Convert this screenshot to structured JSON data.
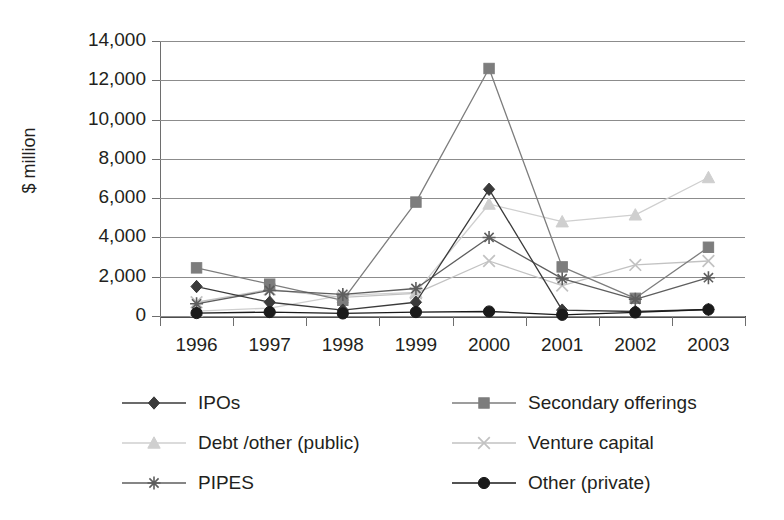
{
  "chart_data": {
    "type": "line",
    "title": "",
    "xlabel": "",
    "ylabel": "$ million",
    "ylim": [
      0,
      14000
    ],
    "ytick_step": 2000,
    "grid": true,
    "legend_position": "bottom",
    "categories": [
      "1996",
      "1997",
      "1998",
      "1999",
      "2000",
      "2001",
      "2002",
      "2003"
    ],
    "ytick_labels": [
      "0",
      "2,000",
      "4,000",
      "6,000",
      "8,000",
      "10,000",
      "12,000",
      "14,000"
    ],
    "series": [
      {
        "name": "IPOs",
        "marker": "diamond",
        "color": "#3a3a3a",
        "values": [
          1500,
          700,
          300,
          700,
          6450,
          300,
          230,
          330
        ]
      },
      {
        "name": "Secondary offerings",
        "marker": "square",
        "color": "#7d7d7d",
        "values": [
          2450,
          1620,
          800,
          5800,
          12600,
          2500,
          900,
          3500
        ]
      },
      {
        "name": "Debt /other (public)",
        "marker": "triangle",
        "color": "#cfcfcf",
        "values": [
          250,
          400,
          1050,
          1200,
          5700,
          4800,
          5150,
          7050
        ]
      },
      {
        "name": "Venture capital",
        "marker": "cross",
        "color": "#c2c2c2",
        "values": [
          700,
          1350,
          950,
          1150,
          2800,
          1550,
          2600,
          2800
        ]
      },
      {
        "name": "PIPES",
        "marker": "asterisk",
        "color": "#5e5e5e",
        "values": [
          620,
          1300,
          1100,
          1400,
          4000,
          1900,
          850,
          1950
        ]
      },
      {
        "name": "Other (private)",
        "marker": "circle",
        "color": "#1a1a1a",
        "values": [
          150,
          200,
          130,
          200,
          230,
          60,
          180,
          330
        ]
      }
    ]
  },
  "axis": {
    "y_title": "$ million"
  },
  "legend": {
    "items": [
      {
        "label": "IPOs",
        "marker": "diamond",
        "color": "#3a3a3a"
      },
      {
        "label": "Secondary offerings",
        "marker": "square",
        "color": "#7d7d7d"
      },
      {
        "label": "Debt /other (public)",
        "marker": "triangle",
        "color": "#cfcfcf"
      },
      {
        "label": "Venture capital",
        "marker": "cross",
        "color": "#c2c2c2"
      },
      {
        "label": "PIPES",
        "marker": "asterisk",
        "color": "#5e5e5e"
      },
      {
        "label": "Other (private)",
        "marker": "circle",
        "color": "#1a1a1a"
      }
    ]
  }
}
